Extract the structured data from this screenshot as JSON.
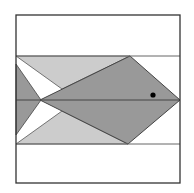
{
  "diagram": {
    "canvas": {
      "width": 194,
      "height": 193
    },
    "colors": {
      "background": "#ffffff",
      "frame": "#333333",
      "band_line": "#555555",
      "fish_body": "#999999",
      "fins": "#cccccc",
      "tail": "#999999",
      "eye": "#000000",
      "edge": "#444444"
    },
    "frame": {
      "x": 16,
      "y": 15,
      "width": 164,
      "height": 168
    },
    "band": {
      "top_y": 56,
      "bottom_y": 144,
      "mid_y": 100
    },
    "shapes": {
      "upper_fin": "16,56 130,56 62,89",
      "lower_fin": "16,144 128,144 62,111",
      "fish_body": "40,100 130,56 180,100 128,144",
      "tail": "16,64 41,100 16,135",
      "eye": {
        "cx": 153,
        "cy": 95,
        "r": 2.6
      }
    }
  }
}
